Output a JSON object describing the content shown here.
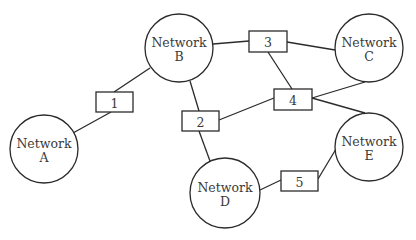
{
  "diagram": {
    "title": "",
    "width": 416,
    "height": 240,
    "stroke_color": "#2b2b2b",
    "text_color": "#3a3a3a",
    "networks": [
      {
        "id": "A",
        "line1": "Network",
        "line2": "A",
        "cx": 44,
        "cy": 149,
        "r": 34
      },
      {
        "id": "B",
        "line1": "Network",
        "line2": "B",
        "cx": 179,
        "cy": 48,
        "r": 34
      },
      {
        "id": "C",
        "line1": "Network",
        "line2": "C",
        "cx": 369,
        "cy": 48,
        "r": 34
      },
      {
        "id": "D",
        "line1": "Network",
        "line2": "D",
        "cx": 225,
        "cy": 193,
        "r": 35
      },
      {
        "id": "E",
        "line1": "Network",
        "line2": "E",
        "cx": 369,
        "cy": 147,
        "r": 34
      }
    ],
    "routers": [
      {
        "id": "1",
        "label": "1",
        "x": 96,
        "y": 92,
        "w": 37,
        "h": 20
      },
      {
        "id": "2",
        "label": "2",
        "x": 182,
        "y": 111,
        "w": 37,
        "h": 20
      },
      {
        "id": "3",
        "label": "3",
        "x": 249,
        "y": 31,
        "w": 38,
        "h": 21
      },
      {
        "id": "4",
        "label": "4",
        "x": 274,
        "y": 89,
        "w": 38,
        "h": 21
      },
      {
        "id": "5",
        "label": "5",
        "x": 281,
        "y": 171,
        "w": 37,
        "h": 20
      }
    ],
    "edges": [
      {
        "from": "Network A",
        "to": "Router 1",
        "x1": 73,
        "y1": 133,
        "x2": 111,
        "y2": 112
      },
      {
        "from": "Router 1",
        "to": "Network B",
        "x1": 114,
        "y1": 92,
        "x2": 150,
        "y2": 68
      },
      {
        "from": "Network B",
        "to": "Router 3",
        "x1": 213,
        "y1": 44,
        "x2": 249,
        "y2": 41
      },
      {
        "from": "Router 3",
        "to": "Network C",
        "x1": 287,
        "y1": 42,
        "x2": 335,
        "y2": 50
      },
      {
        "from": "Network B",
        "to": "Router 2",
        "x1": 190,
        "y1": 81,
        "x2": 199,
        "y2": 111
      },
      {
        "from": "Router 2",
        "to": "Network D",
        "x1": 199,
        "y1": 131,
        "x2": 210,
        "y2": 161
      },
      {
        "from": "Router 2",
        "to": "Router 4",
        "x1": 219,
        "y1": 120,
        "x2": 274,
        "y2": 98
      },
      {
        "from": "Router 3",
        "to": "Router 4",
        "x1": 268,
        "y1": 52,
        "x2": 292,
        "y2": 89
      },
      {
        "from": "Router 4",
        "to": "Network C",
        "x1": 312,
        "y1": 98,
        "x2": 365,
        "y2": 82
      },
      {
        "from": "Router 4",
        "to": "Network E",
        "x1": 312,
        "y1": 98,
        "x2": 365,
        "y2": 113
      },
      {
        "from": "Network D",
        "to": "Router 5",
        "x1": 260,
        "y1": 190,
        "x2": 281,
        "y2": 180
      },
      {
        "from": "Router 5",
        "to": "Network E",
        "x1": 318,
        "y1": 179,
        "x2": 336,
        "y2": 149
      }
    ]
  }
}
